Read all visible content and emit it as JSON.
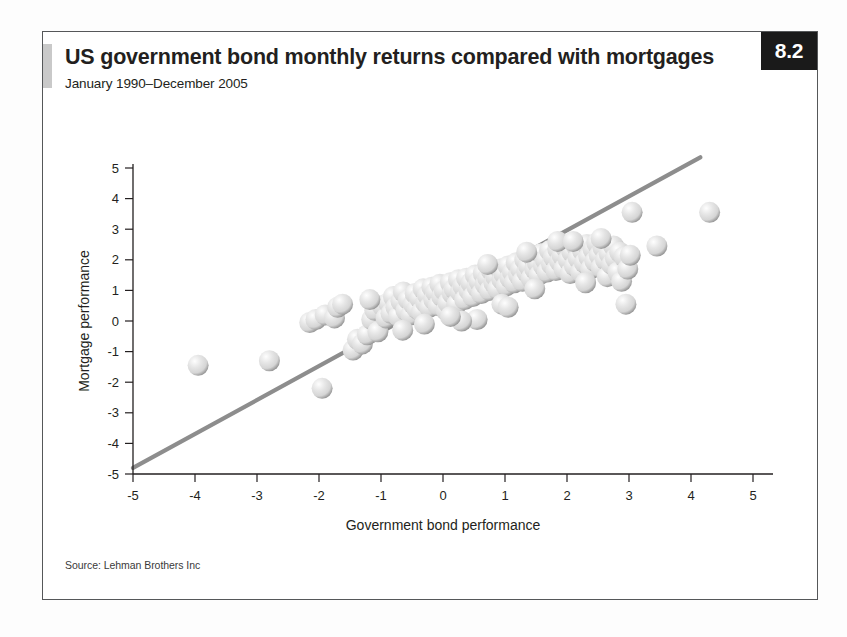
{
  "figure": {
    "badge": "8.2",
    "title": "US government bond monthly returns compared with mortgages",
    "subtitle": "January 1990–December 2005",
    "source": "Source: Lehman Brothers Inc"
  },
  "colors": {
    "frame_border": "#555759",
    "badge_bg": "#1a1a1a",
    "badge_text": "#ffffff",
    "accent_bar": "#c9c9c9",
    "axis": "#231f20",
    "trendline": "#8d8d8d",
    "marker_fill": "#d5d5d5",
    "marker_highlight": "#fefefe",
    "marker_shadow": "#9a9a9a",
    "text": "#231f20"
  },
  "chart_data": {
    "type": "scatter",
    "title": "US government bond monthly returns compared with mortgages",
    "subtitle": "January 1990–December 2005",
    "xlabel": "Government bond performance",
    "ylabel": "Mortgage performance",
    "xlim": [
      -5,
      5
    ],
    "ylim": [
      -5,
      5
    ],
    "xticks": [
      -5,
      -4,
      -3,
      -2,
      -1,
      0,
      1,
      2,
      3,
      4,
      5
    ],
    "yticks": [
      -5,
      -4,
      -3,
      -2,
      -1,
      0,
      1,
      2,
      3,
      4,
      5
    ],
    "xtick_labels": [
      "-5",
      "-4",
      "-3",
      "-2",
      "-1",
      "0",
      "1",
      "2",
      "3",
      "4",
      "5"
    ],
    "ytick_labels": [
      "-5",
      "-4",
      "-3",
      "-2",
      "-1",
      "0",
      "1",
      "2",
      "3",
      "4",
      "5"
    ],
    "grid": false,
    "legend": null,
    "marker_style": "3d-sphere",
    "trendline": {
      "type": "linear",
      "x_start": -5.0,
      "y_start": -4.8,
      "x_end": 4.15,
      "y_end": 5.35,
      "slope": 1.11,
      "intercept": 0.75
    },
    "points": [
      [
        -3.95,
        -1.45
      ],
      [
        -2.8,
        -1.3
      ],
      [
        -2.15,
        -0.05
      ],
      [
        -2.05,
        0.05
      ],
      [
        -1.95,
        -2.2
      ],
      [
        -1.9,
        0.2
      ],
      [
        -1.75,
        0.1
      ],
      [
        -1.7,
        0.45
      ],
      [
        -1.62,
        0.55
      ],
      [
        -1.45,
        -0.95
      ],
      [
        -1.38,
        -0.6
      ],
      [
        -1.3,
        -0.75
      ],
      [
        -1.22,
        -0.45
      ],
      [
        -1.15,
        0.05
      ],
      [
        -1.1,
        0.35
      ],
      [
        -1.05,
        -0.35
      ],
      [
        -0.98,
        0.5
      ],
      [
        -0.92,
        0.1
      ],
      [
        -0.88,
        0.6
      ],
      [
        -0.84,
        0.25
      ],
      [
        -0.8,
        0.8
      ],
      [
        -0.76,
        0.45
      ],
      [
        -0.72,
        0.15
      ],
      [
        -0.68,
        0.65
      ],
      [
        -0.64,
        0.95
      ],
      [
        -0.6,
        0.35
      ],
      [
        -0.56,
        0.7
      ],
      [
        -0.52,
        0.2
      ],
      [
        -0.48,
        0.55
      ],
      [
        -0.45,
        0.9
      ],
      [
        -0.42,
        0.4
      ],
      [
        -0.38,
        0.75
      ],
      [
        -0.35,
        0.3
      ],
      [
        -0.32,
        1.05
      ],
      [
        -0.28,
        0.6
      ],
      [
        -0.25,
        0.85
      ],
      [
        -0.22,
        0.45
      ],
      [
        -0.18,
        1.1
      ],
      [
        -0.15,
        0.7
      ],
      [
        -0.12,
        0.95
      ],
      [
        -0.08,
        0.5
      ],
      [
        -0.05,
        1.2
      ],
      [
        -0.02,
        0.8
      ],
      [
        0.02,
        1.0
      ],
      [
        0.05,
        0.35
      ],
      [
        0.08,
        0.6
      ],
      [
        0.12,
        1.25
      ],
      [
        0.15,
        0.9
      ],
      [
        0.18,
        1.05
      ],
      [
        0.22,
        0.55
      ],
      [
        0.25,
        1.35
      ],
      [
        0.28,
        0.95
      ],
      [
        0.32,
        1.15
      ],
      [
        0.35,
        0.7
      ],
      [
        0.38,
        1.4
      ],
      [
        0.42,
        1.0
      ],
      [
        0.45,
        1.25
      ],
      [
        0.48,
        0.8
      ],
      [
        0.52,
        1.5
      ],
      [
        0.55,
        1.1
      ],
      [
        0.58,
        1.3
      ],
      [
        0.62,
        0.9
      ],
      [
        0.65,
        1.55
      ],
      [
        0.68,
        1.2
      ],
      [
        0.72,
        1.4
      ],
      [
        0.75,
        1.0
      ],
      [
        0.78,
        1.65
      ],
      [
        0.82,
        1.25
      ],
      [
        0.85,
        1.45
      ],
      [
        0.88,
        1.05
      ],
      [
        0.92,
        1.7
      ],
      [
        0.95,
        1.35
      ],
      [
        0.98,
        1.55
      ],
      [
        1.02,
        1.15
      ],
      [
        1.05,
        1.8
      ],
      [
        1.08,
        1.4
      ],
      [
        1.12,
        1.6
      ],
      [
        1.15,
        1.25
      ],
      [
        1.18,
        1.9
      ],
      [
        1.22,
        1.5
      ],
      [
        1.25,
        1.7
      ],
      [
        1.28,
        1.3
      ],
      [
        1.32,
        2.0
      ],
      [
        1.35,
        1.6
      ],
      [
        1.38,
        1.8
      ],
      [
        1.42,
        1.4
      ],
      [
        1.45,
        2.1
      ],
      [
        1.48,
        1.7
      ],
      [
        1.52,
        1.9
      ],
      [
        1.55,
        1.5
      ],
      [
        1.58,
        2.2
      ],
      [
        1.62,
        1.8
      ],
      [
        1.65,
        2.0
      ],
      [
        1.68,
        1.6
      ],
      [
        1.72,
        2.3
      ],
      [
        1.75,
        1.85
      ],
      [
        1.78,
        2.1
      ],
      [
        1.82,
        1.65
      ],
      [
        1.85,
        2.35
      ],
      [
        1.88,
        1.95
      ],
      [
        1.92,
        2.15
      ],
      [
        1.95,
        1.7
      ],
      [
        1.98,
        2.4
      ],
      [
        2.02,
        2.0
      ],
      [
        2.05,
        1.55
      ],
      [
        2.08,
        2.25
      ],
      [
        2.12,
        1.8
      ],
      [
        2.15,
        2.45
      ],
      [
        2.18,
        2.05
      ],
      [
        2.22,
        1.6
      ],
      [
        2.25,
        2.3
      ],
      [
        2.28,
        1.9
      ],
      [
        2.32,
        2.5
      ],
      [
        2.35,
        2.1
      ],
      [
        2.38,
        1.7
      ],
      [
        2.42,
        2.35
      ],
      [
        2.45,
        1.95
      ],
      [
        2.48,
        2.55
      ],
      [
        2.52,
        2.15
      ],
      [
        2.55,
        1.75
      ],
      [
        2.58,
        2.4
      ],
      [
        2.62,
        2.0
      ],
      [
        2.65,
        1.45
      ],
      [
        2.68,
        2.2
      ],
      [
        2.72,
        1.85
      ],
      [
        2.75,
        2.45
      ],
      [
        2.78,
        2.05
      ],
      [
        2.82,
        1.6
      ],
      [
        2.85,
        2.25
      ],
      [
        2.88,
        1.3
      ],
      [
        2.92,
        2.1
      ],
      [
        2.95,
        0.55
      ],
      [
        2.98,
        1.7
      ],
      [
        3.02,
        2.15
      ],
      [
        3.05,
        3.55
      ],
      [
        3.45,
        2.45
      ],
      [
        4.3,
        3.55
      ],
      [
        0.55,
        0.05
      ],
      [
        0.3,
        0.0
      ],
      [
        -0.65,
        -0.3
      ],
      [
        -1.18,
        0.7
      ],
      [
        0.95,
        0.55
      ],
      [
        1.48,
        1.05
      ],
      [
        2.3,
        1.25
      ],
      [
        1.05,
        0.45
      ],
      [
        0.12,
        0.15
      ],
      [
        -0.3,
        -0.1
      ],
      [
        2.55,
        2.7
      ],
      [
        1.85,
        2.6
      ],
      [
        1.35,
        2.25
      ],
      [
        0.72,
        1.85
      ],
      [
        2.1,
        2.6
      ]
    ]
  }
}
